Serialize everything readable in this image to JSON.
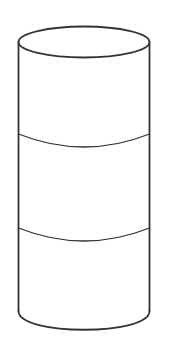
{
  "figure": {
    "stroke_color": "#333333",
    "background": "#ffffff",
    "sections": 3
  }
}
